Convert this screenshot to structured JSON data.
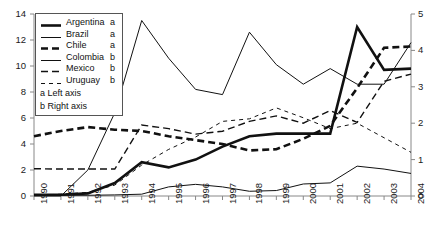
{
  "chart_data": {
    "type": "line",
    "title": "",
    "xlabel": "",
    "ylabel": "",
    "grid": false,
    "legend_position": "top-left",
    "x": [
      1990,
      1991,
      1992,
      1993,
      1994,
      1995,
      1996,
      1997,
      1998,
      1999,
      2000,
      2001,
      2002,
      2003,
      2004
    ],
    "categories": [
      "1990",
      "1991",
      "1992",
      "1993",
      "1994",
      "1995",
      "1996",
      "1997",
      "1998",
      "1999",
      "2000",
      "2001",
      "2002",
      "2003",
      "2004"
    ],
    "left_axis": {
      "min": 0,
      "max": 14,
      "step": 2,
      "ticks": [
        "0",
        "2",
        "4",
        "6",
        "8",
        "10",
        "12",
        "14"
      ]
    },
    "right_axis": {
      "min": 0,
      "max": 5,
      "step": 1,
      "ticks": [
        "0",
        "1",
        "2",
        "3",
        "4",
        "5"
      ]
    },
    "axis_note_left": "a Left axis",
    "axis_note_right": "b Right axis",
    "series": [
      {
        "name": "Argentina",
        "axis": "a",
        "axis_label": "a",
        "style": "thick-solid",
        "values": [
          0.1,
          0.1,
          0.2,
          1.0,
          2.6,
          2.2,
          2.8,
          3.8,
          4.6,
          4.8,
          4.8,
          4.8,
          13.0,
          9.7,
          9.8
        ]
      },
      {
        "name": "Brazil",
        "axis": "a",
        "axis_label": "a",
        "style": "thin-solid",
        "values": [
          0.0,
          0.0,
          2.0,
          6.4,
          13.5,
          10.6,
          8.2,
          7.8,
          12.6,
          10.1,
          8.6,
          9.8,
          8.6,
          8.6,
          11.8
        ]
      },
      {
        "name": "Chile",
        "axis": "a",
        "axis_label": "a",
        "style": "thick-dash",
        "values": [
          4.6,
          5.0,
          5.3,
          5.1,
          5.0,
          4.6,
          4.3,
          4.0,
          3.5,
          3.6,
          4.4,
          5.4,
          8.3,
          11.4,
          11.5
        ]
      },
      {
        "name": "Colombia",
        "axis": "b",
        "axis_label": "b",
        "style": "thin-solid-low",
        "values": [
          0.02,
          0.02,
          0.02,
          0.03,
          0.05,
          0.25,
          0.32,
          0.25,
          0.13,
          0.15,
          0.33,
          0.36,
          0.82,
          0.74,
          0.62
        ]
      },
      {
        "name": "Mexico",
        "axis": "b",
        "axis_label": "b",
        "style": "medium-dash",
        "values": [
          0.75,
          0.74,
          0.74,
          0.74,
          1.95,
          1.85,
          1.7,
          1.78,
          2.05,
          2.2,
          2.0,
          2.35,
          2.02,
          3.15,
          3.35
        ]
      },
      {
        "name": "Uruguay",
        "axis": "b",
        "axis_label": "b",
        "style": "fine-dash",
        "values": [
          0.02,
          0.05,
          0.1,
          0.3,
          0.85,
          1.28,
          1.62,
          2.05,
          2.12,
          2.42,
          2.15,
          1.85,
          2.0,
          1.6,
          1.2
        ]
      }
    ]
  },
  "legend": {
    "entries": [
      {
        "label": "Argentina",
        "axis": "a"
      },
      {
        "label": "Brazil",
        "axis": "a"
      },
      {
        "label": "Chile",
        "axis": "a"
      },
      {
        "label": "Colombia",
        "axis": "b"
      },
      {
        "label": "Mexico",
        "axis": "b"
      },
      {
        "label": "Uruguay",
        "axis": "b"
      }
    ],
    "note_left": "a Left axis",
    "note_right": "b Right axis"
  },
  "colors": {
    "line": "#111111",
    "axis": "#888888",
    "text": "#1a1a1a",
    "background": "#ffffff"
  }
}
